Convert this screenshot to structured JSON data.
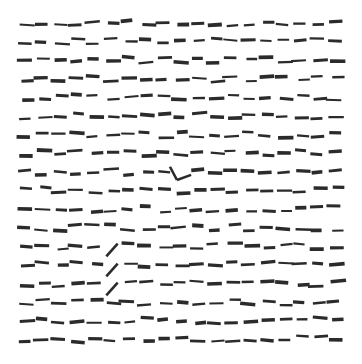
{
  "figure": {
    "name": "visual-search-texture-array",
    "width": 362,
    "height": 364,
    "background_color": "#ffffff",
    "element_color": "#2b2b2b",
    "caption": ""
  },
  "chart_data": {
    "type": "scatter",
    "title": "",
    "subtitle": "",
    "xlabel": "",
    "ylabel": "",
    "grid": false,
    "legend": null,
    "xlim": [
      0,
      362
    ],
    "ylim": [
      0,
      364
    ],
    "layout": {
      "rows": 18,
      "cols": 19,
      "x_start": 26,
      "y_start": 23,
      "x_step": 17.2,
      "y_step": 18.6,
      "segment_length": 13,
      "segment_thickness": 2.6,
      "jitter_x": 3.0,
      "jitter_y": 3.2,
      "jitter_angle_deg": 6
    },
    "targets": [
      {
        "id": "angle-target",
        "shape": "angle",
        "label": "chevron",
        "x": 177,
        "y": 180,
        "arm_length": 15,
        "arm1_angle_deg": -118,
        "arm2_angle_deg": -20
      },
      {
        "id": "diagonal-target-1",
        "shape": "diagonal",
        "label": "slash",
        "x": 112,
        "y": 250,
        "length": 17,
        "angle_deg": -48
      },
      {
        "id": "diagonal-target-2",
        "shape": "diagonal",
        "label": "slash",
        "x": 112,
        "y": 270,
        "length": 17,
        "angle_deg": -48
      },
      {
        "id": "diagonal-target-3",
        "shape": "diagonal",
        "label": "slash",
        "x": 112,
        "y": 289,
        "length": 17,
        "angle_deg": -48
      }
    ],
    "series": [
      {
        "name": "distractors",
        "element": "horizontal-dash",
        "count": 342,
        "orientation_deg": 0
      },
      {
        "name": "targets",
        "element": "oddball",
        "count": 4
      }
    ]
  }
}
